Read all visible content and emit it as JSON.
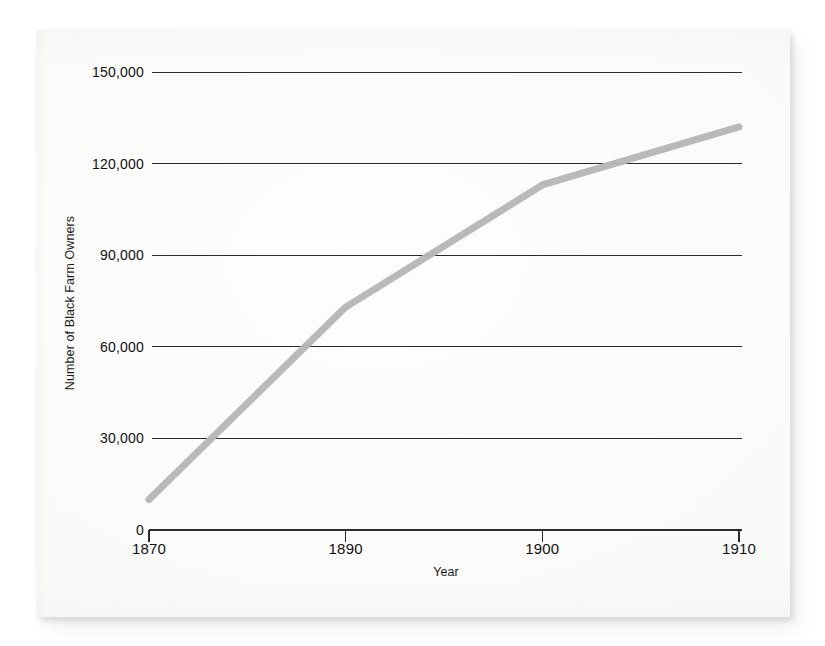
{
  "figure": {
    "background_color": "#fbfbfa",
    "line_color": "#b5b5b5",
    "grid_color": "#2b2b2b",
    "text_color": "#111111"
  },
  "chart_data": {
    "type": "line",
    "title": "",
    "xlabel": "Year",
    "ylabel": "Number of Black Farm Owners",
    "categories": [
      "1870",
      "1890",
      "1900",
      "1910"
    ],
    "x": [
      1870,
      1890,
      1900,
      1910
    ],
    "values": [
      10000,
      73000,
      113000,
      132000
    ],
    "series": [
      {
        "name": "Number of Black Farm Owners",
        "values": [
          10000,
          73000,
          113000,
          132000
        ],
        "color": "#b5b5b5"
      }
    ],
    "ylim": [
      0,
      150000
    ],
    "yticks": [
      0,
      30000,
      60000,
      90000,
      120000,
      150000
    ],
    "ytick_labels": [
      "0",
      "30,000",
      "60,000",
      "90,000",
      "120,000",
      "150,000"
    ],
    "xtick_labels": [
      "1870",
      "1890",
      "1900",
      "1910"
    ],
    "grid": "horizontal",
    "legend": "none",
    "markers": "none",
    "axis_spacing": "categorical-even"
  }
}
